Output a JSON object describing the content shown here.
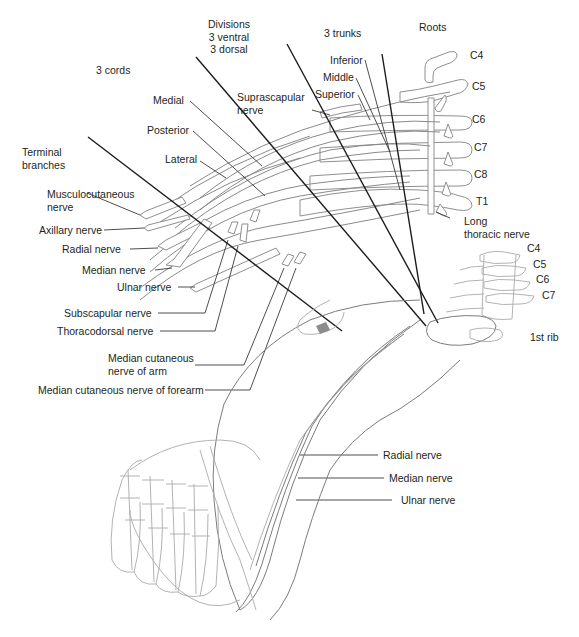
{
  "figure": {
    "colors": {
      "background": "#ffffff",
      "text": "#231f20",
      "nerve_outline": "#8f8f8f",
      "leader_line": "#3a3a3a",
      "section_divider": "#1c1c1c",
      "highlight_artery": "#8c8c8c"
    }
  },
  "section_headers": {
    "roots": "Roots",
    "trunks": "3 trunks",
    "divisions": [
      "Divisions",
      "3 ventral",
      "3 dorsal"
    ],
    "cords": "3 cords",
    "terminal_branches": [
      "Terminal",
      "branches"
    ]
  },
  "roots": {
    "upper": [
      "C4",
      "C5",
      "C6",
      "C7",
      "C8",
      "T1"
    ],
    "vertebral": [
      "C4",
      "C5",
      "C6",
      "C7"
    ]
  },
  "trunks": [
    "Inferior",
    "Middle",
    "Superior"
  ],
  "cords": [
    "Medial",
    "Posterior",
    "Lateral"
  ],
  "branch_labels": {
    "suprascapular": [
      "Suprascapular",
      "nerve"
    ],
    "long_thoracic": [
      "Long",
      "thoracic nerve"
    ],
    "first_rib": "1st rib"
  },
  "terminal_branches": [
    [
      "Musculocutaneous",
      "nerve"
    ],
    "Axillary nerve",
    "Radial nerve",
    "Median nerve",
    "Ulnar nerve"
  ],
  "collateral_branches": [
    "Subscapular nerve",
    "Thoracodorsal nerve",
    [
      "Median cutaneous",
      "nerve of arm"
    ],
    "Median cutaneous nerve of forearm"
  ],
  "arm_labels": [
    "Radial nerve",
    "Median nerve",
    "Ulnar nerve"
  ]
}
